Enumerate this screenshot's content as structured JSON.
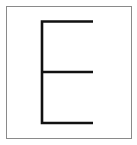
{
  "card": {
    "letter": "E",
    "border_color": "#8a8a8a",
    "background_color": "#ffffff",
    "stroke_color": "#111111"
  }
}
